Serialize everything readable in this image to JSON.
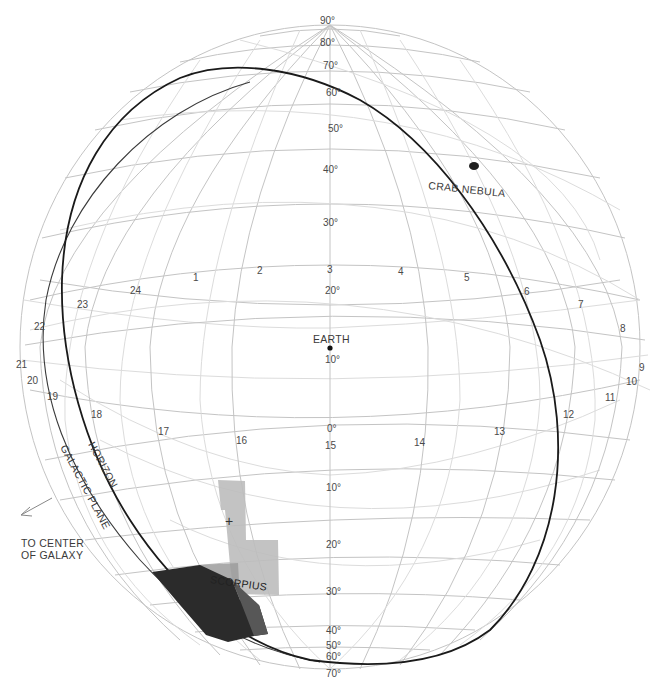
{
  "diagram": {
    "type": "celestial-sphere",
    "center_point": "EARTH",
    "colors": {
      "grid": "#c4c4c4",
      "horizon": "#1a1a1a",
      "scorpius_light": "#b8b8b8",
      "scorpius_dark": "#2a2a2a",
      "crab_nebula": "#222222"
    }
  },
  "declination_labels": {
    "d90": "90°",
    "d80": "80°",
    "d70": "70°",
    "d60": "60°",
    "d50": "50°",
    "d40": "40°",
    "d30": "30°",
    "d20": "20°",
    "d10": "10°",
    "d0": "0°",
    "s10": "10°",
    "s20": "20°",
    "s30": "30°",
    "s40": "40°",
    "s50": "50°",
    "s60": "60°",
    "s70": "70°"
  },
  "hour_labels": {
    "h1": "1",
    "h2": "2",
    "h3": "3",
    "h4": "4",
    "h5": "5",
    "h6": "6",
    "h7": "7",
    "h8": "8",
    "h9": "9",
    "h10": "10",
    "h11": "11",
    "h12": "12",
    "h13": "13",
    "h14": "14",
    "h15": "15",
    "h16": "16",
    "h17": "17",
    "h18": "18",
    "h19": "19",
    "h20": "20",
    "h21": "21",
    "h22": "22",
    "h23": "23",
    "h24": "24"
  },
  "annotations": {
    "earth": "EARTH",
    "crab_nebula": "CRAB NEBULA",
    "horizon": "HORIZON",
    "galactic_plane": "GALACTIC PLANE",
    "scorpius": "SCORPIUS",
    "to_center_line1": "TO CENTER",
    "to_center_line2": "OF GALAXY",
    "cross_marker": "+"
  }
}
